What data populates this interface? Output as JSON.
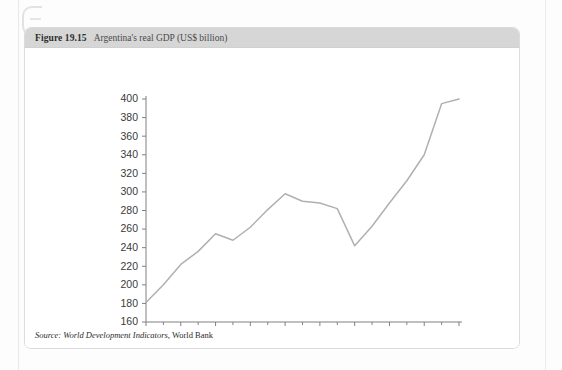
{
  "figure": {
    "number": "Figure 19.15",
    "caption": "Argentina's real GDP (US$ billion)",
    "source_prefix": "Source:",
    "source_italic": "World Development Indicators",
    "source_separator": ",",
    "source_plain": "World Bank"
  },
  "colors": {
    "header_bar": "#d6d6d6",
    "card_border": "#dcdcdc",
    "line": "#b0b0b0",
    "axis": "#808080",
    "tick_label": "#3a3a3a",
    "page": "#fdfdfd"
  },
  "chart_data": {
    "type": "line",
    "title": "Argentina's real GDP (US$ billion)",
    "xlabel": "",
    "ylabel": "",
    "ylim": [
      160,
      400
    ],
    "xlim": [
      1990,
      2008
    ],
    "yticks": [
      160,
      180,
      200,
      220,
      240,
      260,
      280,
      300,
      320,
      340,
      360,
      380,
      400
    ],
    "ytick_labels": [
      "160",
      "180",
      "200",
      "220",
      "240",
      "260",
      "280",
      "300",
      "320",
      "340",
      "360",
      "380",
      "400"
    ],
    "xticks": [
      1990,
      1992,
      1994,
      1996,
      1998,
      2000,
      2002,
      2004,
      2006,
      2008
    ],
    "xtick_labels": [
      "1990",
      "1992",
      "1994",
      "1996",
      "1998",
      "2000",
      "2002",
      "2004",
      "2006",
      "2008"
    ],
    "minor_xticks": [
      1991,
      1993,
      1995,
      1997,
      1999,
      2001,
      2003,
      2005,
      2007
    ],
    "grid": false,
    "legend": false,
    "x": [
      1990,
      1991,
      1992,
      1993,
      1994,
      1995,
      1996,
      1997,
      1998,
      1999,
      2000,
      2001,
      2002,
      2003,
      2004,
      2005,
      2006,
      2007,
      2008
    ],
    "values": [
      181,
      200,
      222,
      236,
      255,
      248,
      262,
      281,
      298,
      290,
      288,
      282,
      242,
      263,
      288,
      312,
      340,
      395,
      400
    ],
    "series": [
      {
        "name": "Argentina real GDP (US$ billion)",
        "values": [
          181,
          200,
          222,
          236,
          255,
          248,
          262,
          281,
          298,
          290,
          288,
          282,
          242,
          263,
          288,
          312,
          340,
          395,
          400
        ]
      }
    ],
    "source": "World Development Indicators, World Bank"
  }
}
